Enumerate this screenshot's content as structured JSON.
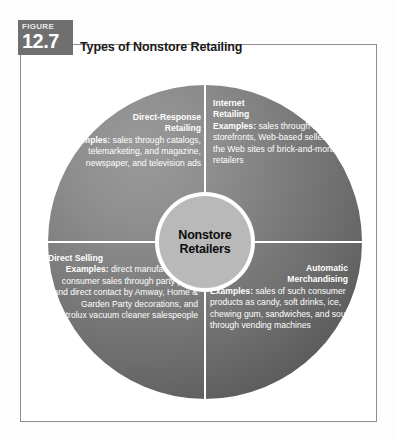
{
  "figure": {
    "badge_word": "FIGURE",
    "badge_number": "12.7",
    "title": "Types of Nonstore Retailing"
  },
  "diagram": {
    "center": {
      "line1": "Nonstore",
      "line2": "Retailers"
    },
    "quadrants": [
      {
        "id": "direct-response-retailing",
        "heading_line1": "Direct-Response",
        "heading_line2": "Retailing",
        "examples_label": "Examples:",
        "examples_text": " sales through catalogs, telemarketing, and magazine, newspaper, and television ads"
      },
      {
        "id": "internet-retailing",
        "heading_line1": "Internet",
        "heading_line2": "Retailing",
        "examples_label": "Examples:",
        "examples_text": " sales through virtual storefronts, Web-based sellers, and the Web sites of brick-and-mortar retailers"
      },
      {
        "id": "direct-selling",
        "heading_line1": "Direct Selling",
        "heading_line2": "",
        "examples_label": "Examples:",
        "examples_text": " direct manufacturer-to-consumer sales through party plans and direct contact by Amway, Home & Garden Party decorations, and Electrolux vacuum cleaner salespeople"
      },
      {
        "id": "automatic-merchandising",
        "heading_line1": "Automatic",
        "heading_line2": "Merchandising",
        "examples_label": "Examples:",
        "examples_text": " sales of such consumer products as candy, soft drinks, ice, chewing gum, sandwiches, and soup through vending machines"
      }
    ]
  },
  "colors": {
    "badge_background": "#6f6f6f",
    "circle_dark": "#535353",
    "circle_light": "#9a9a9a",
    "center_fill": "#b9b9b9",
    "divider": "#ffffff",
    "frame_border": "#8d8d8d",
    "page_background": "#ffffff"
  }
}
